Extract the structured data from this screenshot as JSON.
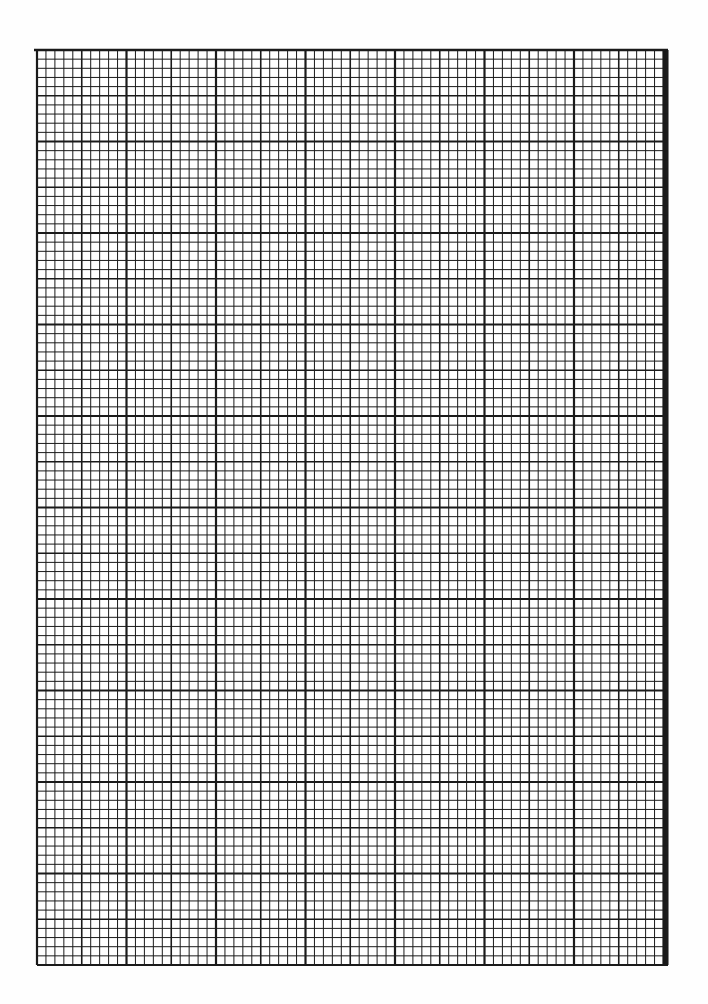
{
  "page": {
    "type": "graph-paper",
    "width": 708,
    "height": 1004,
    "background": "#fefefe"
  },
  "grid": {
    "left": 37,
    "right": 668,
    "top": 50,
    "bottom": 965,
    "major_cols_x": [
      37,
      126.5,
      216,
      305.5,
      395,
      484.5,
      574,
      663.5
    ],
    "major_rows_y": [
      50,
      141.5,
      233,
      324.5,
      416,
      507.5,
      599,
      690.5,
      782,
      873.5,
      965
    ],
    "subdivisions_per_major": 10,
    "medium_every": 5,
    "line_color": "#1a1a1a",
    "minor_width": 1,
    "medium_width": 1.6,
    "major_width": 2.2,
    "top_rule_extend_left": 34,
    "top_rule_width": 2.4
  }
}
